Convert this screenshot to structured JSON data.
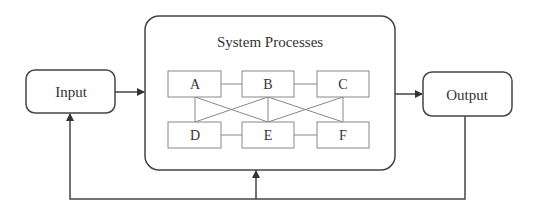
{
  "diagram": {
    "main_box": {
      "title": "System Processes"
    },
    "input": {
      "label": "Input"
    },
    "output": {
      "label": "Output"
    },
    "processes": [
      {
        "id": "A",
        "label": "A"
      },
      {
        "id": "B",
        "label": "B"
      },
      {
        "id": "C",
        "label": "C"
      },
      {
        "id": "D",
        "label": "D"
      },
      {
        "id": "E",
        "label": "E"
      },
      {
        "id": "F",
        "label": "F"
      }
    ],
    "connections": [
      [
        "A",
        "B"
      ],
      [
        "B",
        "C"
      ],
      [
        "D",
        "E"
      ],
      [
        "E",
        "F"
      ],
      [
        "A",
        "D"
      ],
      [
        "B",
        "E"
      ],
      [
        "C",
        "F"
      ],
      [
        "A",
        "E"
      ],
      [
        "B",
        "D"
      ],
      [
        "B",
        "F"
      ],
      [
        "C",
        "E"
      ]
    ],
    "flows": [
      {
        "from": "Input",
        "to": "System Processes"
      },
      {
        "from": "System Processes",
        "to": "Output"
      },
      {
        "from": "Output",
        "to": "Input",
        "type": "feedback"
      },
      {
        "from": "Output",
        "to": "System Processes",
        "type": "feedback"
      }
    ],
    "colors": {
      "stroke": "#444444",
      "inner_stroke": "#777777",
      "text": "#333333",
      "background": "#ffffff"
    }
  }
}
